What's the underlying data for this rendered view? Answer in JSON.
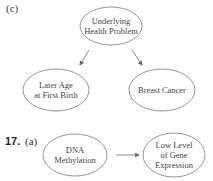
{
  "part_c": {
    "label": "(c)",
    "nodes": {
      "top": {
        "line1": "Underlying",
        "line2": "Health Problem"
      },
      "left": {
        "line1": "Later Age",
        "line2": "at First Birth"
      },
      "right": {
        "line1": "Breast Cancer"
      }
    },
    "edges": [
      {
        "from": "Underlying Health Problem",
        "to": "Later Age at First Birth"
      },
      {
        "from": "Underlying Health Problem",
        "to": "Breast Cancer"
      }
    ]
  },
  "problem_17": {
    "number": "17.",
    "label": "(a)",
    "nodes": {
      "left": {
        "line1": "DNA",
        "line2": "Methylation"
      },
      "right": {
        "line1": "Low Level",
        "line2": "of Gene",
        "line3": "Expression"
      }
    },
    "edges": [
      {
        "from": "DNA Methylation",
        "to": "Low Level of Gene Expression"
      }
    ]
  },
  "colors": {
    "stroke": "#6a6a6a",
    "text": "#444444"
  }
}
